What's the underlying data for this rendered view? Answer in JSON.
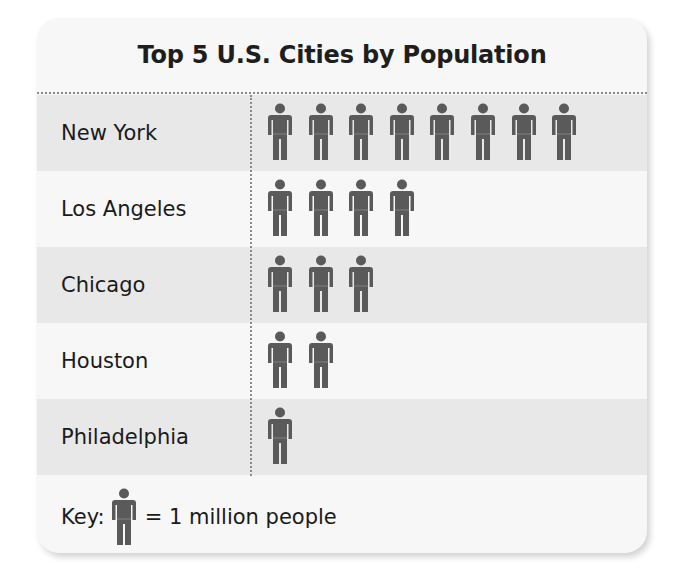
{
  "chart_data": {
    "type": "pictograph",
    "title": "Top 5 U.S. Cities by Population",
    "categories": [
      "New York",
      "Los Angeles",
      "Chicago",
      "Houston",
      "Philadelphia"
    ],
    "values": [
      8,
      4,
      3,
      2,
      1
    ],
    "unit": "million people",
    "key": {
      "icon": "person-icon",
      "value": 1,
      "label": "Key:",
      "text": "= 1 million people"
    },
    "legend_position": "bottom",
    "grid": false
  },
  "colors": {
    "icon": "#5a5a5a",
    "row_shaded": "#e8e8e8",
    "row_plain": "#f7f7f7",
    "divider": "#8a8a8a"
  },
  "rows": [
    {
      "city": "New York",
      "count": 8,
      "style": "shaded"
    },
    {
      "city": "Los Angeles",
      "count": 4,
      "style": "plain"
    },
    {
      "city": "Chicago",
      "count": 3,
      "style": "shaded"
    },
    {
      "city": "Houston",
      "count": 2,
      "style": "plain"
    },
    {
      "city": "Philadelphia",
      "count": 1,
      "style": "shaded"
    }
  ]
}
